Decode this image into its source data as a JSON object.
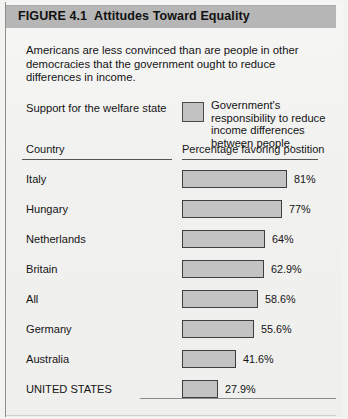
{
  "figure": {
    "number": "FIGURE 4.1",
    "title": "Attitudes Toward Equality",
    "intro": "Americans are less convinced than are people in other democracies that the government ought to reduce differences in income.",
    "welfare_label": "Support for the welfare state",
    "legend_swatch_name": "legend-swatch",
    "legend_text": "Government's responsibility to reduce income differences between people.",
    "column_headers": {
      "country": "Country",
      "percentage": "Percentage favoring postition"
    },
    "colors": {
      "title_band": "#b6b6b6",
      "bar_fill": "#c3c3c3",
      "bar_border": "#3f3f3f",
      "paper": "#f2f2f1",
      "text": "#141414"
    }
  },
  "chart_data": {
    "type": "bar",
    "orientation": "horizontal",
    "subtitle": "Americans are less convinced than are people in other democracies that the government ought to reduce differences in income.",
    "xlabel": "Percentage favoring postition",
    "ylabel": "Country",
    "xlim": [
      0,
      100
    ],
    "grid": false,
    "legend": {
      "position": "top-right",
      "entries": [
        "Government's responsibility to reduce income differences between people."
      ]
    },
    "categories": [
      "Italy",
      "Hungary",
      "Netherlands",
      "Britain",
      "All",
      "Germany",
      "Australia",
      "UNITED STATES"
    ],
    "values": [
      81,
      77,
      64,
      62.9,
      58.6,
      55.6,
      41.6,
      27.9
    ],
    "value_labels": [
      "81%",
      "77%",
      "64%",
      "62.9%",
      "58.6%",
      "55.6%",
      "41.6%",
      "27.9%"
    ],
    "series": [
      {
        "name": "Percentage favoring postition",
        "values": [
          81,
          77,
          64,
          62.9,
          58.6,
          55.6,
          41.6,
          27.9
        ]
      }
    ]
  }
}
